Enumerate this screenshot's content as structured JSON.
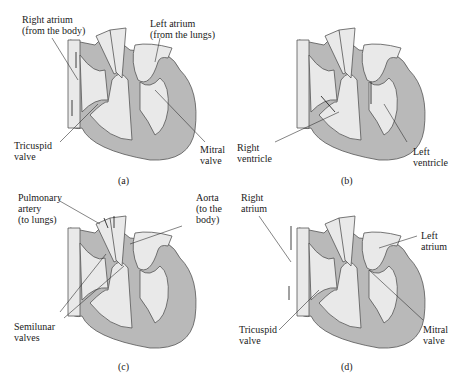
{
  "colors": {
    "wall": "#b9b9b9",
    "chamber": "#e9e9e9",
    "outline": "#555555",
    "text": "#1a1a1a",
    "background": "#ffffff"
  },
  "panels": [
    {
      "id": "a",
      "caption": "(a)",
      "labels": [
        {
          "text": "Right atrium\n(from the body)"
        },
        {
          "text": "Left atrium\n(from the lungs)"
        },
        {
          "text": "Tricuspid\nvalve"
        },
        {
          "text": "Mitral\nvalve"
        }
      ]
    },
    {
      "id": "b",
      "caption": "(b)",
      "labels": [
        {
          "text": "Right\nventricle"
        },
        {
          "text": "Left\nventricle"
        }
      ]
    },
    {
      "id": "c",
      "caption": "(c)",
      "labels": [
        {
          "text": "Pulmonary\nartery\n(to lungs)"
        },
        {
          "text": "Aorta\n(to the\nbody)"
        },
        {
          "text": "Semilunar\nvalves"
        }
      ]
    },
    {
      "id": "d",
      "caption": "(d)",
      "labels": [
        {
          "text": "Right\natrium"
        },
        {
          "text": "Left\natrium"
        },
        {
          "text": "Tricuspid\nvalve"
        },
        {
          "text": "Mitral\nvalve"
        }
      ]
    }
  ]
}
